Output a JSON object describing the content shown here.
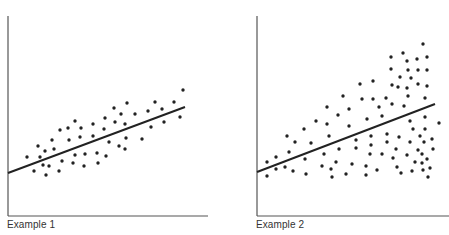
{
  "colors": {
    "axis": "#555555",
    "dot": "#222222",
    "line": "#222222",
    "text": "#333333"
  },
  "chart_data": [
    {
      "type": "scatter",
      "title": "",
      "caption": "Example 1",
      "xlabel": "",
      "ylabel": "",
      "grid": false,
      "legend": null,
      "regression_line": {
        "x1": 8,
        "y1": 173,
        "x2": 185,
        "y2": 107
      },
      "axes": {
        "origin_x": 8,
        "origin_y": 216,
        "x_end": 208,
        "y_top": 16
      },
      "points_px": [
        [
          27,
          157
        ],
        [
          34,
          171
        ],
        [
          38,
          146
        ],
        [
          40,
          157
        ],
        [
          43,
          165
        ],
        [
          45,
          151
        ],
        [
          46,
          175
        ],
        [
          49,
          166
        ],
        [
          52,
          140
        ],
        [
          54,
          149
        ],
        [
          59,
          171
        ],
        [
          60,
          130
        ],
        [
          62,
          161
        ],
        [
          68,
          128
        ],
        [
          69,
          140
        ],
        [
          73,
          163
        ],
        [
          75,
          121
        ],
        [
          75,
          155
        ],
        [
          81,
          128
        ],
        [
          80,
          137
        ],
        [
          84,
          166
        ],
        [
          85,
          154
        ],
        [
          93,
          124
        ],
        [
          93,
          136
        ],
        [
          97,
          153
        ],
        [
          98,
          163
        ],
        [
          105,
          118
        ],
        [
          104,
          129
        ],
        [
          106,
          156
        ],
        [
          109,
          142
        ],
        [
          114,
          108
        ],
        [
          115,
          122
        ],
        [
          119,
          146
        ],
        [
          121,
          114
        ],
        [
          125,
          124
        ],
        [
          126,
          138
        ],
        [
          125,
          149
        ],
        [
          127,
          103
        ],
        [
          135,
          114
        ],
        [
          142,
          139
        ],
        [
          148,
          111
        ],
        [
          151,
          127
        ],
        [
          155,
          102
        ],
        [
          162,
          109
        ],
        [
          164,
          122
        ],
        [
          174,
          102
        ],
        [
          180,
          117
        ],
        [
          183,
          90
        ]
      ],
      "description": "Homoscedastic: points evenly scattered around an upward-sloping regression line"
    },
    {
      "type": "scatter",
      "title": "",
      "caption": "Example 2",
      "xlabel": "",
      "ylabel": "",
      "grid": false,
      "legend": null,
      "regression_line": {
        "x1": 257,
        "y1": 172,
        "x2": 435,
        "y2": 104
      },
      "axes": {
        "origin_x": 257,
        "origin_y": 216,
        "x_end": 449,
        "y_top": 16
      },
      "points_px": [
        [
          267,
          162
        ],
        [
          276,
          157
        ],
        [
          267,
          176
        ],
        [
          276,
          169
        ],
        [
          285,
          167
        ],
        [
          287,
          136
        ],
        [
          289,
          152
        ],
        [
          293,
          171
        ],
        [
          295,
          142
        ],
        [
          304,
          129
        ],
        [
          305,
          159
        ],
        [
          306,
          174
        ],
        [
          311,
          143
        ],
        [
          316,
          121
        ],
        [
          322,
          166
        ],
        [
          324,
          154
        ],
        [
          327,
          107
        ],
        [
          327,
          124
        ],
        [
          329,
          136
        ],
        [
          331,
          169
        ],
        [
          332,
          177
        ],
        [
          336,
          162
        ],
        [
          338,
          115
        ],
        [
          339,
          149
        ],
        [
          343,
          96
        ],
        [
          346,
          174
        ],
        [
          349,
          126
        ],
        [
          349,
          109
        ],
        [
          352,
          164
        ],
        [
          356,
          140
        ],
        [
          356,
          148
        ],
        [
          360,
          84
        ],
        [
          362,
          99
        ],
        [
          366,
          166
        ],
        [
          366,
          175
        ],
        [
          367,
          119
        ],
        [
          370,
          154
        ],
        [
          371,
          136
        ],
        [
          371,
          145
        ],
        [
          373,
          81
        ],
        [
          373,
          99
        ],
        [
          377,
          170
        ],
        [
          379,
          107
        ],
        [
          382,
          116
        ],
        [
          382,
          154
        ],
        [
          386,
          98
        ],
        [
          387,
          134
        ],
        [
          387,
          142
        ],
        [
          391,
          57
        ],
        [
          391,
          69
        ],
        [
          392,
          85
        ],
        [
          392,
          104
        ],
        [
          393,
          158
        ],
        [
          396,
          149
        ],
        [
          397,
          167
        ],
        [
          399,
          137
        ],
        [
          400,
          77
        ],
        [
          401,
          173
        ],
        [
          403,
          53
        ],
        [
          404,
          106
        ],
        [
          398,
          87
        ],
        [
          407,
          61
        ],
        [
          407,
          88
        ],
        [
          407,
          155
        ],
        [
          408,
          70
        ],
        [
          408,
          96
        ],
        [
          410,
          121
        ],
        [
          410,
          142
        ],
        [
          411,
          78
        ],
        [
          412,
          171
        ],
        [
          413,
          129
        ],
        [
          415,
          162
        ],
        [
          417,
          59
        ],
        [
          418,
          70
        ],
        [
          418,
          84
        ],
        [
          418,
          150
        ],
        [
          420,
          136
        ],
        [
          422,
          154
        ],
        [
          422,
          163
        ],
        [
          423,
          170
        ],
        [
          423,
          44
        ],
        [
          424,
          142
        ],
        [
          425,
          98
        ],
        [
          425,
          117
        ],
        [
          425,
          129
        ],
        [
          427,
          57
        ],
        [
          427,
          70
        ],
        [
          427,
          86
        ],
        [
          427,
          159
        ],
        [
          428,
          177
        ],
        [
          430,
          168
        ],
        [
          432,
          139
        ],
        [
          433,
          149
        ],
        [
          439,
          123
        ]
      ],
      "description": "Heteroscedastic: spread of points around the regression line increases with x"
    }
  ],
  "captions": {
    "left": "Example 1",
    "right": "Example 2"
  }
}
